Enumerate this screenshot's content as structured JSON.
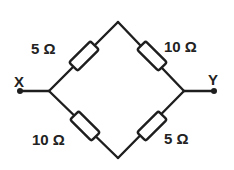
{
  "diagram": {
    "type": "resistor-bridge-circuit",
    "terminals": {
      "left": "X",
      "right": "Y"
    },
    "resistors": [
      {
        "position": "top-left",
        "label": "5 Ω",
        "value_ohms": 5
      },
      {
        "position": "top-right",
        "label": "10 Ω",
        "value_ohms": 10
      },
      {
        "position": "bottom-left",
        "label": "10 Ω",
        "value_ohms": 10
      },
      {
        "position": "bottom-right",
        "label": "5 Ω",
        "value_ohms": 5
      }
    ],
    "colors": {
      "line": "#1e1e1e",
      "text": "#222222",
      "background": "#ffffff"
    }
  }
}
